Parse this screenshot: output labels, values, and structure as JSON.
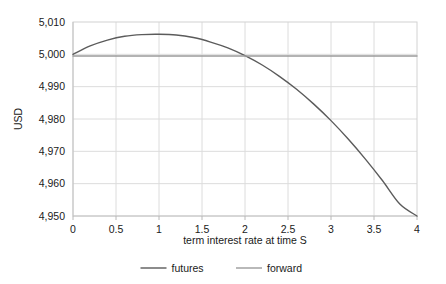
{
  "chart_data": {
    "type": "line",
    "title": "",
    "xlabel": "term interest rate at time S",
    "ylabel": "USD",
    "xlim": [
      0,
      4
    ],
    "ylim": [
      4950,
      5010
    ],
    "grid": true,
    "legend_position": "bottom",
    "xticks": [
      "0",
      "0.5",
      "1",
      "1.5",
      "2",
      "2.5",
      "3",
      "3.5",
      "4"
    ],
    "xtick_values": [
      0,
      0.5,
      1,
      1.5,
      2,
      2.5,
      3,
      3.5,
      4
    ],
    "yticks": [
      "4,950",
      "4,960",
      "4,970",
      "4,980",
      "4,990",
      "5,000",
      "5,010"
    ],
    "ytick_values": [
      4950,
      4960,
      4970,
      4980,
      4990,
      5000,
      5010
    ],
    "x": [
      0,
      0.2,
      0.4,
      0.6,
      0.8,
      1,
      1.2,
      1.4,
      1.6,
      1.8,
      2,
      2.2,
      2.4,
      2.6,
      2.8,
      3,
      3.2,
      3.4,
      3.6,
      3.8,
      4
    ],
    "series": [
      {
        "name": "futures",
        "color": "#5b5b5b",
        "width": 1.4,
        "values": [
          5000.0,
          5002.6,
          5004.4,
          5005.6,
          5006.1,
          5006.2,
          5006.0,
          5005.2,
          5003.8,
          5002.0,
          4999.6,
          4996.7,
          4993.2,
          4989.2,
          4984.6,
          4979.5,
          4973.8,
          4967.6,
          4960.9,
          4953.7,
          4950.0
        ]
      },
      {
        "name": "forward",
        "color": "#9b9b9b",
        "width": 1.4,
        "values": [
          4999.5,
          4999.5,
          4999.5,
          4999.5,
          4999.5,
          4999.5,
          4999.5,
          4999.5,
          4999.5,
          4999.5,
          4999.5,
          4999.5,
          4999.5,
          4999.5,
          4999.5,
          4999.5,
          4999.5,
          4999.5,
          4999.5,
          4999.5,
          4999.5
        ]
      }
    ],
    "legend": [
      {
        "label": "futures",
        "color": "#5b5b5b"
      },
      {
        "label": "forward",
        "color": "#9b9b9b"
      }
    ],
    "colors": {
      "futures": "#5b5b5b",
      "forward": "#9b9b9b",
      "grid": "#dcdcdc",
      "axis": "#c9c9c9",
      "text": "#1a1a1a",
      "background": "#ffffff"
    }
  }
}
